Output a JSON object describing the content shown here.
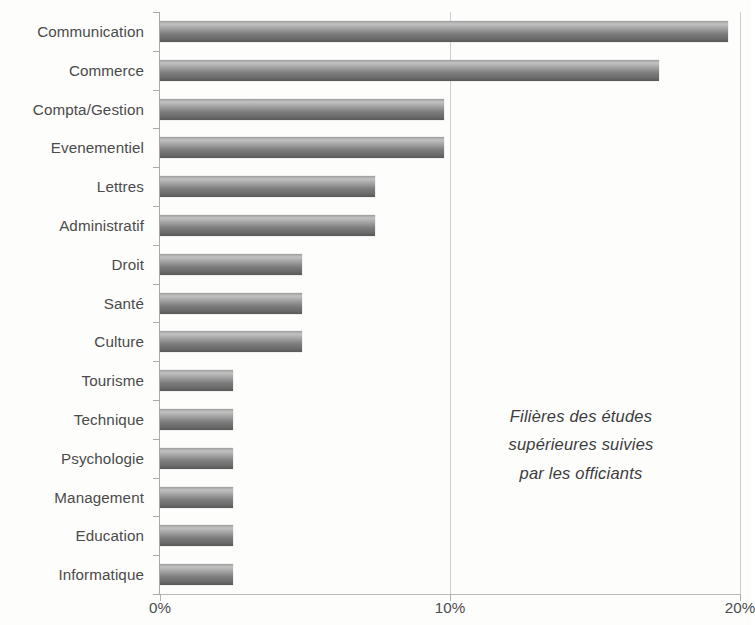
{
  "chart_data": {
    "type": "bar",
    "orientation": "horizontal",
    "title": "",
    "annotation": "Filières des études supérieures suivies par les officiants",
    "annotation_lines": [
      "Filières des études",
      "supérieures suivies",
      "par les officiants"
    ],
    "xlabel": "",
    "ylabel": "",
    "categories": [
      "Communication",
      "Commerce",
      "Compta/Gestion",
      "Evenementiel",
      "Lettres",
      "Administratif",
      "Droit",
      "Santé",
      "Culture",
      "Tourisme",
      "Technique",
      "Psychologie",
      "Management",
      "Education",
      "Informatique"
    ],
    "values": [
      19.6,
      17.2,
      9.8,
      9.8,
      7.4,
      7.4,
      4.9,
      4.9,
      4.9,
      2.5,
      2.5,
      2.5,
      2.5,
      2.5,
      2.5
    ],
    "value_unit": "%",
    "xlim": [
      0,
      20
    ],
    "xticks": [
      0,
      10,
      20
    ],
    "xtick_labels": [
      "0%",
      "10%",
      "20%"
    ],
    "grid": "vertical",
    "legend": "none",
    "bar_color": "#7c7c7c",
    "bar_color_light": "#c2c2c2",
    "text_color": "#4b4b4b",
    "axis_color": "#a9a9a9",
    "gridline_color": "#cdcdcd",
    "background": "#fdfdfc"
  }
}
